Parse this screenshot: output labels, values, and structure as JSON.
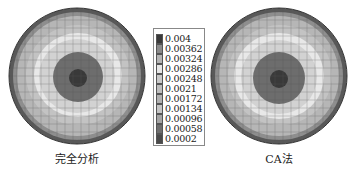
{
  "figure": {
    "plots": [
      {
        "id": "left",
        "caption": "完全分析"
      },
      {
        "id": "right",
        "caption": "CA法"
      }
    ],
    "legend": {
      "entries": [
        {
          "label": "0.004",
          "color": "#3a3a3a"
        },
        {
          "label": "0.00362",
          "color": "#8a8a8a"
        },
        {
          "label": "0.00324",
          "color": "#b4b4b4"
        },
        {
          "label": "0.00286",
          "color": "#e6e6e6"
        },
        {
          "label": "0.00248",
          "color": "#c8c8c8"
        },
        {
          "label": "0.0021",
          "color": "#bdbdbd"
        },
        {
          "label": "0.00172",
          "color": "#b0b0b0"
        },
        {
          "label": "0.00134",
          "color": "#c4c4c4"
        },
        {
          "label": "0.00096",
          "color": "#a4a4a4"
        },
        {
          "label": "0.00058",
          "color": "#6e6e6e"
        },
        {
          "label": "0.0002",
          "color": "#4a4a4a"
        }
      ]
    }
  }
}
